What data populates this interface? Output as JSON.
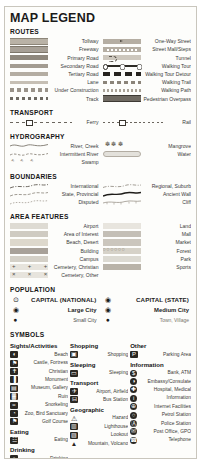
{
  "title": "MAP LEGEND",
  "sections": {
    "routes": {
      "heading": "ROUTES",
      "left": [
        {
          "label": "Tollway",
          "style": "r-tollway"
        },
        {
          "label": "Freeway",
          "style": "r-freeway"
        },
        {
          "label": "Primary Road",
          "style": "r-primary"
        },
        {
          "label": "Secondary Road",
          "style": "r-secondary"
        },
        {
          "label": "Tertiary Road",
          "style": "r-tertiary"
        },
        {
          "label": "Lane",
          "style": "r-lane"
        },
        {
          "label": "Under Construction",
          "style": "r-construct"
        },
        {
          "label": "Track",
          "style": "r-track"
        }
      ],
      "right": [
        {
          "label": "One-Way Street",
          "style": "r-oneway"
        },
        {
          "label": "Street Mall/Steps",
          "style": "r-mall"
        },
        {
          "label": "Tunnel",
          "style": "r-tunnel"
        },
        {
          "label": "Walking Tour",
          "style": "r-wtour"
        },
        {
          "label": "Walking Tour Detour",
          "style": "r-wdetour"
        },
        {
          "label": "Walking Trail",
          "style": "r-wtrail"
        },
        {
          "label": "Walking Path",
          "style": "r-wpath"
        },
        {
          "label": "Pedestrian Overpass",
          "style": "r-overpass"
        }
      ]
    },
    "transport": {
      "heading": "TRANSPORT",
      "left": [
        {
          "label": "Ferry",
          "style": "t-ferry"
        }
      ],
      "right": [
        {
          "label": "Rail",
          "style": "t-rail"
        }
      ]
    },
    "hydrography": {
      "heading": "HYDROGRAPHY",
      "left": [
        {
          "label": "River, Creek",
          "style": "h-wave"
        },
        {
          "label": "Intermittent River",
          "style": "h-wave"
        },
        {
          "label": "Swamp",
          "style": "h-swamp"
        }
      ],
      "right": [
        {
          "label": "Mangrove",
          "style": "h-mangrove"
        },
        {
          "label": "Water",
          "style": "h-water"
        }
      ]
    },
    "boundaries": {
      "heading": "BOUNDARIES",
      "left": [
        {
          "label": "International",
          "style": "b-line"
        },
        {
          "label": "State, Provincial",
          "style": "b-line"
        },
        {
          "label": "Disputed",
          "style": "b-line"
        }
      ],
      "right": [
        {
          "label": "Regional, Suburb",
          "style": "b-line"
        },
        {
          "label": "Ancient Wall",
          "style": "b-line"
        },
        {
          "label": "Cliff",
          "style": "b-line"
        }
      ]
    },
    "area_features": {
      "heading": "AREA FEATURES",
      "left": [
        {
          "label": "Airport",
          "style": "a-airport"
        },
        {
          "label": "Area of Interest",
          "style": "a-interest"
        },
        {
          "label": "Beach, Desert",
          "style": "a-beach"
        },
        {
          "label": "Building",
          "style": "a-building"
        },
        {
          "label": "Campus",
          "style": "a-campus"
        },
        {
          "label": "Cemetery, Christian",
          "style": "a-cemc"
        },
        {
          "label": "Cemetery, Other",
          "style": "a-cemo"
        }
      ],
      "right": [
        {
          "label": "Land",
          "style": "a-land"
        },
        {
          "label": "Mall",
          "style": "a-mall"
        },
        {
          "label": "Market",
          "style": "a-market"
        },
        {
          "label": "Forest",
          "style": "a-forest"
        },
        {
          "label": "Park",
          "style": "a-park"
        },
        {
          "label": "Sports",
          "style": "a-sports"
        }
      ]
    },
    "population": {
      "heading": "POPULATION",
      "left": [
        {
          "symbol": "⊙",
          "label": "CAPITAL (NATIONAL)",
          "size": "big"
        },
        {
          "symbol": "◉",
          "label": "Large City",
          "size": "mid"
        },
        {
          "symbol": "●",
          "label": "Small City",
          "size": "small"
        }
      ],
      "right": [
        {
          "symbol": "◉",
          "label": "CAPITAL (STATE)",
          "size": "big"
        },
        {
          "symbol": "◉",
          "label": "Medium City",
          "size": "mid"
        },
        {
          "symbol": "●",
          "label": "Town, Village",
          "size": "tiny"
        }
      ]
    },
    "symbols": {
      "heading": "SYMBOLS",
      "groups": [
        {
          "column": 1,
          "title": "Sights/Activities",
          "items": [
            {
              "icon": "beach-icon",
              "glyph": "◖",
              "label": "Beach"
            },
            {
              "icon": "castle-icon",
              "glyph": "⚑",
              "label": "Castle, Fortress"
            },
            {
              "icon": "christian-icon",
              "glyph": "✝",
              "label": "Christian"
            },
            {
              "icon": "monument-icon",
              "glyph": "▐",
              "label": "Monument"
            },
            {
              "icon": "museum-icon",
              "glyph": "▤",
              "label": "Museum, Gallery"
            },
            {
              "icon": "ruin-icon",
              "glyph": "▓",
              "label": "Ruin"
            },
            {
              "icon": "snorkeling-icon",
              "glyph": "≈",
              "label": "Snorkeling"
            },
            {
              "icon": "zoo-icon",
              "glyph": "◔",
              "label": "Zoo, Bird Sanctuary"
            },
            {
              "icon": "golf-icon",
              "glyph": "⚑",
              "label": "Golf Course"
            }
          ]
        },
        {
          "column": 1,
          "title": "Eating",
          "items": [
            {
              "icon": "eating-icon",
              "glyph": "☳",
              "label": "Eating"
            }
          ]
        },
        {
          "column": 1,
          "title": "Drinking",
          "items": [
            {
              "icon": "drinking-icon",
              "glyph": "▫",
              "label": "Drinking"
            }
          ]
        },
        {
          "column": 1,
          "title": "Entertainment",
          "items": []
        },
        {
          "column": 2,
          "title": "Shopping",
          "items": [
            {
              "icon": "shopping-icon",
              "glyph": "▣",
              "label": "Shopping"
            }
          ]
        },
        {
          "column": 2,
          "title": "Sleeping",
          "items": [
            {
              "icon": "sleeping-icon",
              "glyph": "▭",
              "label": "Sleeping"
            }
          ]
        },
        {
          "column": 2,
          "title": "Transport",
          "items": [
            {
              "icon": "airport-icon",
              "glyph": "✈",
              "label": "Airport, Airfield"
            },
            {
              "icon": "bus-icon",
              "glyph": "⊟",
              "label": "Bus Station"
            }
          ]
        },
        {
          "column": 2,
          "title": "Geographic",
          "items": [
            {
              "icon": "hazard-icon",
              "glyph": "⚠",
              "label": "Hazard",
              "shape": "tri"
            },
            {
              "icon": "lighthouse-icon",
              "glyph": "▥",
              "label": "Lighthouse"
            },
            {
              "icon": "lookout-icon",
              "glyph": "▨",
              "label": "Lookout"
            },
            {
              "icon": "mountain-icon",
              "glyph": "▲",
              "label": "Mountain, Volcano",
              "shape": "tri"
            }
          ]
        },
        {
          "column": 3,
          "title": "Other",
          "items": [
            {
              "icon": "parking-icon",
              "glyph": "P",
              "label": "Parking Area"
            }
          ]
        },
        {
          "column": 3,
          "title": "Information",
          "items": [
            {
              "icon": "bank-icon",
              "glyph": "$",
              "label": "Bank, ATM",
              "shape": "round"
            },
            {
              "icon": "embassy-icon",
              "glyph": "◑",
              "label": "Embassy/Consulate",
              "shape": "round"
            },
            {
              "icon": "hospital-icon",
              "glyph": "✚",
              "label": "Hospital, Medical",
              "shape": "round"
            },
            {
              "icon": "information-icon",
              "glyph": "i",
              "label": "Information",
              "shape": "round"
            },
            {
              "icon": "internet-icon",
              "glyph": "⊕",
              "label": "Internet Facilities",
              "shape": "round"
            },
            {
              "icon": "petrol-icon",
              "glyph": "○",
              "label": "Petrol Station",
              "shape": "round"
            },
            {
              "icon": "police-icon",
              "glyph": "Ⓐ",
              "label": "Police Station",
              "shape": "round"
            },
            {
              "icon": "post-icon",
              "glyph": "✉",
              "label": "Post Office, GPO",
              "shape": "round"
            },
            {
              "icon": "telephone-icon",
              "glyph": "☎",
              "label": "Telephone",
              "shape": "round"
            }
          ]
        }
      ]
    }
  }
}
